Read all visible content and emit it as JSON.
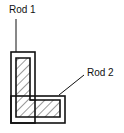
{
  "diagram": {
    "labels": [
      {
        "id": "rod1",
        "text": "Rod 1"
      },
      {
        "id": "rod2",
        "text": "Rod 2"
      }
    ],
    "colors": {
      "stroke": "#111111",
      "background": "#ffffff"
    }
  }
}
